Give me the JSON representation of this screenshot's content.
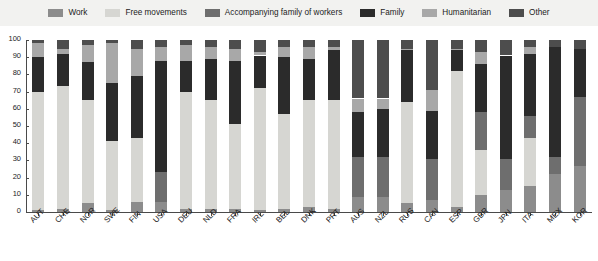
{
  "legend": {
    "items": [
      {
        "label": "Work",
        "color": "#8c8c8c",
        "key": "work"
      },
      {
        "label": "Free movements",
        "color": "#d6d6d2",
        "key": "free_movements"
      },
      {
        "label": "Accompanying family of workers",
        "color": "#6e6e6e",
        "key": "accompanying_family"
      },
      {
        "label": "Family",
        "color": "#2b2b2b",
        "key": "family"
      },
      {
        "label": "Humanitarian",
        "color": "#a8a8a8",
        "key": "humanitarian"
      },
      {
        "label": "Other",
        "color": "#4d4d4d",
        "key": "other"
      }
    ]
  },
  "chart_data": {
    "type": "bar",
    "subtype": "stacked-bar-100",
    "title": "",
    "xlabel": "",
    "ylabel": "",
    "ylim": [
      0,
      100
    ],
    "yticks": [
      0,
      10,
      20,
      30,
      40,
      50,
      60,
      70,
      80,
      90,
      100
    ],
    "grid": false,
    "legend_position": "top",
    "categories": [
      "AUT",
      "CHE",
      "NOR",
      "SWE",
      "FIN",
      "USA",
      "DEU",
      "NLD",
      "FRA",
      "IRL",
      "BEL",
      "DNK",
      "PRT",
      "AUS",
      "NZL",
      "RUS",
      "CAN",
      "ESP",
      "GBR",
      "JPN",
      "ITA",
      "MEX",
      "KOR"
    ],
    "series": [
      {
        "name": "Work",
        "color": "#8c8c8c",
        "values": [
          1,
          2,
          5,
          1,
          6,
          6,
          2,
          2,
          2,
          1,
          2,
          3,
          2,
          9,
          9,
          5,
          7,
          3,
          10,
          13,
          15,
          22,
          27
        ]
      },
      {
        "name": "Free movements",
        "color": "#d6d6d2",
        "values": [
          69,
          71,
          60,
          40,
          37,
          0,
          68,
          63,
          49,
          71,
          55,
          62,
          63,
          0,
          0,
          59,
          0,
          79,
          26,
          0,
          28,
          0,
          0
        ]
      },
      {
        "name": "Accompanying family of workers",
        "color": "#6e6e6e",
        "values": [
          0,
          0,
          0,
          0,
          0,
          17,
          0,
          0,
          0,
          0,
          0,
          0,
          0,
          23,
          23,
          0,
          24,
          0,
          22,
          18,
          13,
          10,
          40
        ]
      },
      {
        "name": "Family",
        "color": "#2b2b2b",
        "values": [
          20,
          19,
          22,
          34,
          36,
          65,
          18,
          24,
          37,
          19,
          33,
          24,
          29,
          26,
          28,
          30,
          28,
          12,
          28,
          60,
          36,
          64,
          28
        ]
      },
      {
        "name": "Humanitarian",
        "color": "#a8a8a8",
        "values": [
          8,
          3,
          10,
          23,
          16,
          8,
          9,
          7,
          7,
          2,
          6,
          7,
          2,
          8,
          6,
          1,
          12,
          1,
          7,
          0,
          4,
          0,
          0
        ]
      },
      {
        "name": "Other",
        "color": "#4d4d4d",
        "values": [
          2,
          5,
          3,
          2,
          5,
          4,
          3,
          4,
          5,
          7,
          4,
          4,
          4,
          34,
          34,
          5,
          29,
          5,
          7,
          9,
          4,
          4,
          5
        ]
      }
    ]
  }
}
